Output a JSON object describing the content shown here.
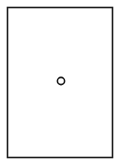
{
  "diagram": {
    "background": "#ffffff",
    "stroke_color": "#1a1a1a",
    "frame": {
      "x": 7.5,
      "y": 7.5,
      "width": 105,
      "height": 150,
      "stroke_width": 1.6
    },
    "marker": {
      "shape": "circle",
      "cx": 61,
      "cy": 81,
      "r": 3.6,
      "stroke_width": 1.6,
      "fill": "none"
    }
  }
}
